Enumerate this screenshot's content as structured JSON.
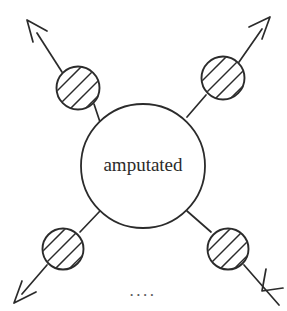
{
  "diagram": {
    "background_color": "#ffffff",
    "stroke_color": "#2b2b2b",
    "center": {
      "label": "amputated",
      "cx": 143,
      "cy": 166,
      "r": 62
    },
    "ellipsis": {
      "label": "....",
      "x": 143,
      "y": 296
    },
    "blobs": [
      {
        "name": "blob-top-left",
        "cx": 78,
        "cy": 88,
        "r": 22,
        "hatch_direction": "lower-left-to-upper-right",
        "hatch_count": 4
      },
      {
        "name": "blob-top-right",
        "cx": 223,
        "cy": 78,
        "r": 22,
        "hatch_direction": "lower-left-to-upper-right",
        "hatch_count": 4
      },
      {
        "name": "blob-bottom-left",
        "cx": 63,
        "cy": 249,
        "r": 21,
        "hatch_direction": "lower-left-to-upper-right",
        "hatch_count": 4
      },
      {
        "name": "blob-bottom-right",
        "cx": 228,
        "cy": 249,
        "r": 21,
        "hatch_direction": "lower-left-to-upper-right",
        "hatch_count": 4
      }
    ],
    "legs": [
      {
        "name": "leg-top-left",
        "direction": "up-left",
        "inner_x": 100,
        "inner_y": 122,
        "blob_near_x": 94,
        "blob_near_y": 104,
        "blob_far_x": 62,
        "blob_far_y": 72,
        "tip_x": 33,
        "tip_y": 28,
        "arrow_at": "tip"
      },
      {
        "name": "leg-top-right",
        "direction": "up-right",
        "inner_x": 187,
        "inner_y": 117,
        "blob_near_x": 207,
        "blob_near_y": 94,
        "blob_far_x": 239,
        "blob_far_y": 62,
        "tip_x": 265,
        "tip_y": 24,
        "arrow_at": "tip"
      },
      {
        "name": "leg-bottom-left",
        "direction": "down-left",
        "inner_x": 100,
        "inner_y": 211,
        "blob_near_x": 79,
        "blob_near_y": 233,
        "blob_far_x": 47,
        "blob_far_y": 265,
        "tip_x": 20,
        "tip_y": 296,
        "arrow_at": "tip"
      },
      {
        "name": "leg-bottom-right",
        "direction": "down-right",
        "inner_x": 187,
        "inner_y": 211,
        "blob_near_x": 212,
        "blob_near_y": 233,
        "blob_far_x": 244,
        "blob_far_y": 265,
        "tip_x": 277,
        "tip_y": 302,
        "arrow_at": "tip"
      }
    ]
  }
}
